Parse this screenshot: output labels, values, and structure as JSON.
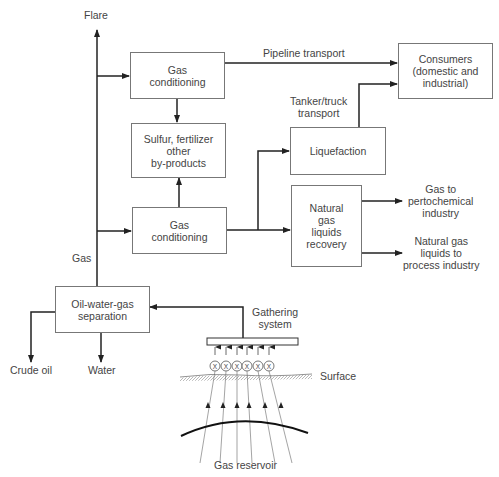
{
  "diagram": {
    "nodes": {
      "gas_conditioning_1": [
        "Gas",
        "conditioning"
      ],
      "sulfur_byproducts": [
        "Sulfur, fertilizer",
        "other",
        "by-products"
      ],
      "gas_conditioning_2": [
        "Gas",
        "conditioning"
      ],
      "oil_water_gas_separation": [
        "Oil-water-gas",
        "separation"
      ],
      "consumers": [
        "Consumers",
        "(domestic and",
        "industrial)"
      ],
      "liquefaction": [
        "Liquefaction"
      ],
      "ngl_recovery": [
        "Natural",
        "gas",
        "liquids",
        "recovery"
      ]
    },
    "labels": {
      "flare": "Flare",
      "gas": "Gas",
      "pipeline_transport": "Pipeline transport",
      "tanker_truck_transport": [
        "Tanker/truck",
        "transport"
      ],
      "gas_to_petrochemical": [
        "Gas to",
        "pertochemical",
        "industry"
      ],
      "ngl_to_process": [
        "Natural gas",
        "liquids to",
        "process industry"
      ],
      "gathering_system": [
        "Gathering",
        "system"
      ],
      "crude_oil": "Crude oil",
      "water": "Water",
      "surface": "Surface",
      "gas_reservoir": "Gas reservoir"
    },
    "wellheads": [
      "X",
      "X",
      "X",
      "X",
      "X",
      "X"
    ],
    "edges": [
      {
        "from": "gas_line",
        "to": "flare"
      },
      {
        "from": "gas_line",
        "to": "gas_conditioning_1"
      },
      {
        "from": "gas_line",
        "to": "gas_conditioning_2"
      },
      {
        "from": "gas_conditioning_1",
        "to": "consumers",
        "label": "Pipeline transport"
      },
      {
        "from": "gas_conditioning_1",
        "to": "sulfur_byproducts"
      },
      {
        "from": "gas_conditioning_2",
        "to": "sulfur_byproducts"
      },
      {
        "from": "gas_conditioning_2",
        "to": "liquefaction"
      },
      {
        "from": "gas_conditioning_2",
        "to": "ngl_recovery"
      },
      {
        "from": "liquefaction",
        "to": "consumers",
        "label": "Tanker/truck transport"
      },
      {
        "from": "ngl_recovery",
        "to": "gas_to_petrochemical"
      },
      {
        "from": "ngl_recovery",
        "to": "ngl_to_process"
      },
      {
        "from": "oil_water_gas_separation",
        "to": "gas_line",
        "label": "Gas"
      },
      {
        "from": "oil_water_gas_separation",
        "to": "crude_oil"
      },
      {
        "from": "oil_water_gas_separation",
        "to": "water"
      },
      {
        "from": "gathering_system",
        "to": "oil_water_gas_separation"
      },
      {
        "from": "gas_reservoir",
        "to": "gathering_system"
      }
    ]
  }
}
